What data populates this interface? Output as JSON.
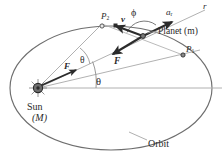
{
  "figure": {
    "background": "#ffffff",
    "stroke_dark": "#2b2b2b",
    "stroke_light": "#9a9a9a",
    "text_color": "#2a2a2a"
  },
  "labels": {
    "radius_line": "r",
    "radial_accel": "a",
    "radial_accel_sub": "r",
    "phi_angle": "ϕ",
    "velocity": "v",
    "point_p2": "P",
    "point_p2_sub": "2",
    "planet": "Planet (m)",
    "point_p1": "P",
    "point_p1_sub": "1",
    "force_at_planet": "F",
    "force_at_sun": "F",
    "delta_theta": "θ",
    "theta_angle": "θ",
    "sun": "Sun",
    "sun_mass": "(M)",
    "orbit": "Orbit"
  },
  "geometry": {
    "ellipse": {
      "cx": 111,
      "cy": 88,
      "rx": 101,
      "ry": 62
    },
    "sun": {
      "x": 38,
      "y": 88,
      "radius": 4.5
    },
    "planet": {
      "x": 143,
      "y": 36
    },
    "p1": {
      "x": 183,
      "y": 55
    },
    "p2": {
      "x": 102,
      "y": 24
    },
    "axis_y": 88,
    "axis_x_start": 38,
    "axis_x_end": 222,
    "theta_arc_radius": 58,
    "phi_arc_radius": 18
  }
}
